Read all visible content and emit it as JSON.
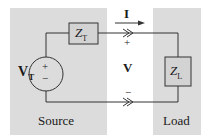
{
  "diagram": {
    "type": "circuit",
    "colors": {
      "panel": "#dcdcdc",
      "background": "#ffffff",
      "wire": "#333333",
      "box_fill": "#d3d3d3"
    },
    "panels": [
      {
        "id": "source",
        "label": "Source"
      },
      {
        "id": "load",
        "label": "Load"
      }
    ],
    "components": {
      "source_voltage": {
        "label": "V",
        "subscript": "T",
        "plus": "+",
        "minus": "−"
      },
      "source_impedance": {
        "label": "Z",
        "subscript": "T"
      },
      "load_impedance": {
        "label": "Z",
        "subscript": "L"
      }
    },
    "current": {
      "label": "I"
    },
    "voltage": {
      "label": "V",
      "plus": "+",
      "minus": "−"
    },
    "terminal_symbol": "≫"
  }
}
